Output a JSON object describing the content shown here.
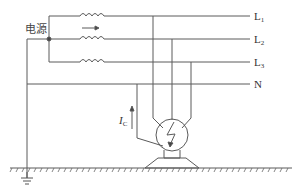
{
  "diagram": {
    "type": "electrical-circuit",
    "source_label": "电源",
    "lines": [
      {
        "id": "L1",
        "main": "L",
        "sub": "1",
        "y": 16
      },
      {
        "id": "L2",
        "main": "L",
        "sub": "2",
        "y": 39
      },
      {
        "id": "L3",
        "main": "L",
        "sub": "3",
        "y": 62
      },
      {
        "id": "N",
        "main": "N",
        "sub": "",
        "y": 84
      }
    ],
    "current_label": {
      "main": "I",
      "sub": "C"
    },
    "colors": {
      "stroke": "#555555",
      "background": "#ffffff"
    }
  }
}
